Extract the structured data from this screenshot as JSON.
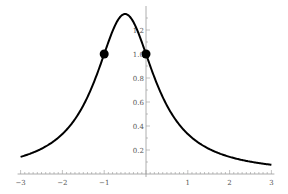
{
  "chart_data": {
    "type": "line",
    "title": "",
    "xlabel": "",
    "ylabel": "",
    "function": "1/(x^2 + x + 1)",
    "xlim": [
      -3,
      3
    ],
    "ylim": [
      0,
      1.35
    ],
    "x_ticks": [
      "-3",
      "-2",
      "-1",
      "1",
      "2",
      "3"
    ],
    "y_ticks": [
      "0.2",
      "0.4",
      "0.6",
      "0.8",
      "1.0",
      "1.2"
    ],
    "grid": false,
    "series": [
      {
        "name": "f(x)",
        "x": [
          -3,
          -2.5,
          -2,
          -1.5,
          -1,
          -0.75,
          -0.5,
          -0.25,
          0,
          0.5,
          1,
          1.5,
          2,
          2.5,
          3
        ],
        "values": [
          0.143,
          0.211,
          0.333,
          0.571,
          1.0,
          1.231,
          1.333,
          1.231,
          1.0,
          0.571,
          0.333,
          0.211,
          0.143,
          0.105,
          0.077
        ]
      }
    ],
    "highlighted_points": [
      {
        "x": -1,
        "y": 1.0
      },
      {
        "x": 0,
        "y": 1.0
      }
    ],
    "line_color": "#000000",
    "point_color": "#000000"
  }
}
